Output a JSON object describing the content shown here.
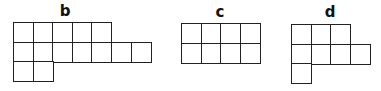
{
  "figures": [
    {
      "label": "b",
      "label_pos": [
        65,
        4
      ],
      "origin": [
        13,
        22
      ],
      "cell": 19.6,
      "rows": [
        {
          "start": 0,
          "count": 5
        },
        {
          "start": 0,
          "count": 7
        },
        {
          "start": 0,
          "count": 2
        }
      ]
    },
    {
      "label": "c",
      "label_pos": [
        220,
        5
      ],
      "origin": [
        181,
        23
      ],
      "cell": 19.6,
      "rows": [
        {
          "start": 0,
          "count": 4
        },
        {
          "start": 0,
          "count": 4
        }
      ]
    },
    {
      "label": "d",
      "label_pos": [
        330,
        5
      ],
      "origin": [
        291,
        24
      ],
      "cell": 19.6,
      "rows": [
        {
          "start": 0,
          "count": 3
        },
        {
          "start": 0,
          "count": 4
        },
        {
          "start": 0,
          "count": 1
        }
      ]
    }
  ],
  "colors": {
    "line": "#222222",
    "background": "#ffffff"
  }
}
